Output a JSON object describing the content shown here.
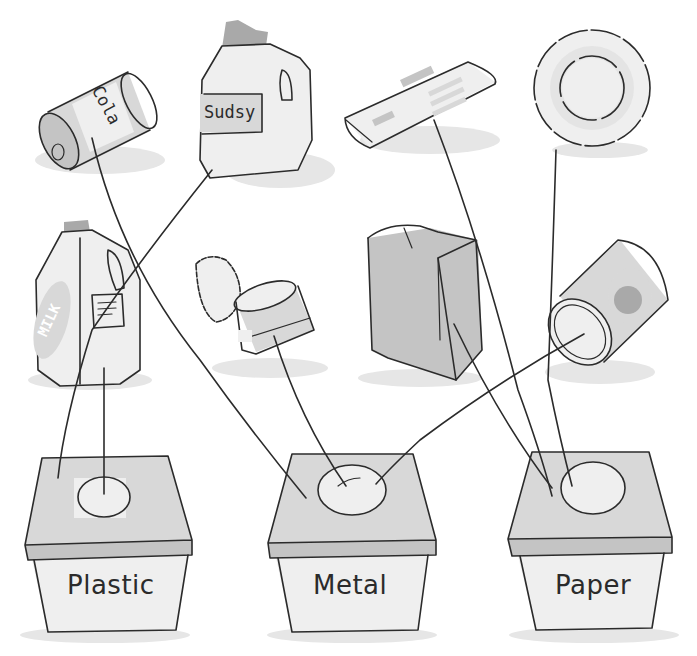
{
  "items": [
    {
      "id": "cola-can",
      "label": "Cola",
      "material": "Metal"
    },
    {
      "id": "sudsy-jug",
      "label": "Sudsy",
      "material": "Plastic"
    },
    {
      "id": "newspaper",
      "label": "",
      "material": "Paper"
    },
    {
      "id": "paper-plate",
      "label": "",
      "material": "Paper"
    },
    {
      "id": "milk-jug",
      "label": "MILK",
      "material": "Plastic"
    },
    {
      "id": "tuna-can",
      "label": "",
      "material": "Metal"
    },
    {
      "id": "paper-bag",
      "label": "",
      "material": "Paper"
    },
    {
      "id": "food-can",
      "label": "",
      "material": "Metal"
    }
  ],
  "bins": [
    {
      "id": "plastic",
      "label": "Plastic"
    },
    {
      "id": "metal",
      "label": "Metal"
    },
    {
      "id": "paper",
      "label": "Paper"
    }
  ],
  "connections": [
    {
      "from": "cola-can",
      "to": "metal"
    },
    {
      "from": "sudsy-jug",
      "to": "plastic"
    },
    {
      "from": "milk-jug",
      "to": "plastic"
    },
    {
      "from": "tuna-can",
      "to": "metal"
    },
    {
      "from": "food-can",
      "to": "metal"
    },
    {
      "from": "newspaper",
      "to": "paper"
    },
    {
      "from": "paper-plate",
      "to": "paper"
    },
    {
      "from": "paper-bag",
      "to": "paper"
    }
  ],
  "colors": {
    "ink": "#2b2b2b",
    "wash": "#d8d8d8",
    "dark_wash": "#a9a9a9",
    "background": "#ffffff"
  }
}
